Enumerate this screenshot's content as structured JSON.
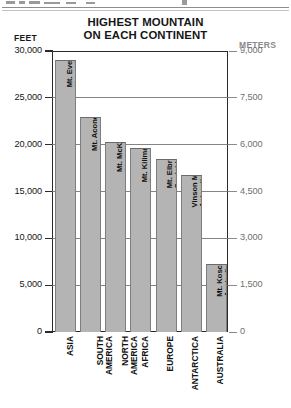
{
  "chart_data": {
    "type": "bar",
    "title": "HIGHEST MOUNTAIN ON EACH CONTINENT",
    "title_line1": "HIGHEST MOUNTAIN",
    "title_line2": "ON EACH CONTINENT",
    "xlabel": "",
    "ylabel": "FEET",
    "y2label": "METERS",
    "ylim": [
      0,
      30000
    ],
    "y2lim": [
      0,
      9000
    ],
    "grid": false,
    "legend": "none",
    "bar_color": "#b4b4b4",
    "categories": [
      "ASIA",
      "SOUTH AMERICA",
      "NORTH AMERICA",
      "AFRICA",
      "EUROPE",
      "ANTARCTICA",
      "AUSTRALIA"
    ],
    "values": [
      29000,
      23000,
      20300,
      19600,
      18500,
      16800,
      7300
    ],
    "yticks": [
      "30,000",
      "25,000",
      "20,000",
      "15,000",
      "10,000",
      "5,000",
      "0"
    ],
    "ytick_values": [
      30000,
      25000,
      20000,
      15000,
      10000,
      5000,
      0
    ],
    "y2ticks": [
      "9,000",
      "7,500",
      "6,000",
      "4,500",
      "3,000",
      "1,500",
      "0"
    ],
    "y2tick_values": [
      9000,
      7500,
      6000,
      4500,
      3000,
      1500,
      0
    ],
    "bars": [
      {
        "continent_line1": "ASIA",
        "continent_line2": "",
        "peak_line1": "Mt. Everest,",
        "peak_line2": "Nepal-Tibet",
        "feet": 29000
      },
      {
        "continent_line1": "SOUTH",
        "continent_line2": "AMERICA",
        "peak_line1": "Mt. Aconcagua,",
        "peak_line2": "Argentina",
        "feet": 23000
      },
      {
        "continent_line1": "NORTH",
        "continent_line2": "AMERICA",
        "peak_line1": "Mt. McKinley,",
        "peak_line2": "Alaska",
        "feet": 20300
      },
      {
        "continent_line1": "AFRICA",
        "continent_line2": "",
        "peak_line1": "Mt. Kilimanjaro,",
        "peak_line2": "Tanzania",
        "feet": 19600
      },
      {
        "continent_line1": "EUROPE",
        "continent_line2": "",
        "peak_line1": "Mt. Elbrus,",
        "peak_line2": "Soviet Union",
        "feet": 18500
      },
      {
        "continent_line1": "ANTARCTICA",
        "continent_line2": "",
        "peak_line1": "Vinson Massif,",
        "peak_line2": "Antarctica",
        "feet": 16800
      },
      {
        "continent_line1": "AUSTRALIA",
        "continent_line2": "",
        "peak_line1": "Mt. Kosciusko,",
        "peak_line2": "Australia",
        "feet": 7300
      }
    ]
  }
}
